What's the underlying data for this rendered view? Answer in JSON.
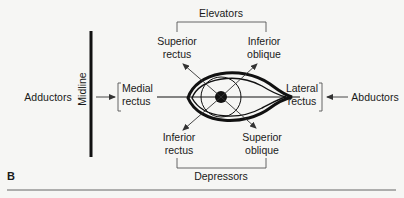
{
  "figure": {
    "panel_label": "B",
    "groups": {
      "top": "Elevators",
      "bottom": "Depressors",
      "left": "Adductors",
      "right": "Abductors"
    },
    "midline_label": "Midline",
    "muscles": {
      "superior_rectus": {
        "line1": "Superior",
        "line2": "rectus"
      },
      "inferior_oblique": {
        "line1": "Inferior",
        "line2": "oblique"
      },
      "inferior_rectus": {
        "line1": "Inferior",
        "line2": "rectus"
      },
      "superior_oblique": {
        "line1": "Superior",
        "line2": "oblique"
      },
      "medial_rectus": {
        "line1": "Medial",
        "line2": "rectus"
      },
      "lateral_rectus": {
        "line1": "Lateral",
        "line2": "rectus"
      }
    },
    "colors": {
      "ink": "#1a1a1a",
      "bracket": "#555555",
      "background": "#f6f6f4"
    }
  }
}
